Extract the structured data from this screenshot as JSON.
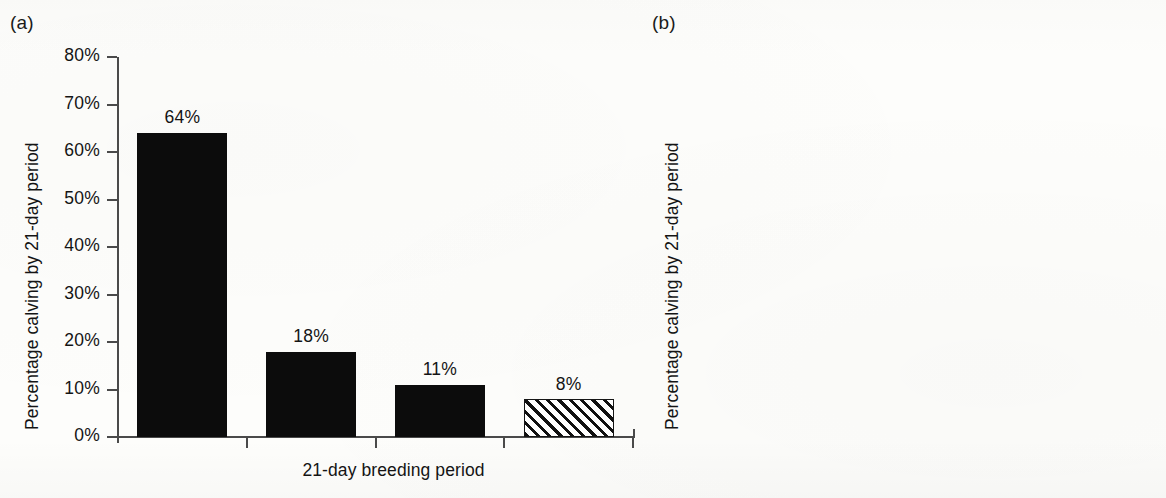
{
  "chart_data": [
    {
      "type": "bar",
      "panel": "(a)",
      "title": "",
      "xlabel": "21-day breeding period",
      "ylabel": "Percentage calving by 21-day period",
      "ylim": [
        0,
        80
      ],
      "ytick_labels": [
        "80%",
        "70%",
        "60%",
        "50%",
        "40%",
        "30%",
        "20%",
        "10%",
        "0%"
      ],
      "ytick_values": [
        80,
        70,
        60,
        50,
        40,
        30,
        20,
        10,
        0
      ],
      "grid": false,
      "legend": "none",
      "categories": [
        "1",
        "2",
        "3",
        "4"
      ],
      "values": [
        64,
        18,
        11,
        8
      ],
      "data_labels": [
        "64%",
        "18%",
        "11%",
        "8%"
      ],
      "bar_styles": [
        "solid",
        "solid",
        "solid",
        "hatched"
      ],
      "bar_color": "#0c0c0c",
      "hatch_color": "#111111"
    },
    {
      "type": "bar",
      "panel": "(b)",
      "title": "",
      "xlabel": "21-day breeding period",
      "ylabel": "Percentage calving by 21-day period",
      "ylim": [
        0,
        80
      ],
      "ytick_labels": [
        "80%",
        "70%",
        "60%",
        "50%",
        "40%",
        "30%",
        "20%",
        "10%",
        "0%"
      ],
      "ytick_values": [
        80,
        70,
        60,
        50,
        40,
        30,
        20,
        10,
        0
      ],
      "grid": false,
      "legend": "none",
      "categories": [
        "1",
        "2",
        "3"
      ],
      "values": [
        62,
        5,
        13
      ],
      "data_labels": [
        "62%",
        "5%",
        "13%"
      ],
      "bar_styles": [
        "solid",
        "solid",
        "solid"
      ],
      "bar_color": "#0c0c0c"
    }
  ],
  "panels": {
    "a": {
      "letter": "(a)",
      "ylabel": "Percentage calving by 21-day period",
      "xlabel": "21-day breeding period",
      "yticks": [
        "80%",
        "70%",
        "60%",
        "50%",
        "40%",
        "30%",
        "20%",
        "10%",
        "0%"
      ],
      "bars": [
        {
          "label": "64%",
          "value": 64,
          "style": "solid"
        },
        {
          "label": "18%",
          "value": 18,
          "style": "solid"
        },
        {
          "label": "11%",
          "value": 11,
          "style": "solid"
        },
        {
          "label": "8%",
          "value": 8,
          "style": "hatched"
        }
      ]
    },
    "b": {
      "letter": "(b)",
      "ylabel": "Percentage calving by 21-day period",
      "xlabel": "21-day breeding period",
      "yticks": [
        "80%",
        "70%",
        "60%",
        "50%",
        "40%",
        "30%",
        "20%",
        "10%",
        "0%"
      ],
      "bars": [
        {
          "label": "62%",
          "value": 62,
          "style": "solid"
        },
        {
          "label": "5%",
          "value": 5,
          "style": "solid"
        },
        {
          "label": "13%",
          "value": 13,
          "style": "solid"
        }
      ]
    }
  },
  "colors": {
    "background": "#fdfdfb",
    "ink": "#141414",
    "axis": "#4a4a4a",
    "bar_fill": "#0c0c0c"
  }
}
